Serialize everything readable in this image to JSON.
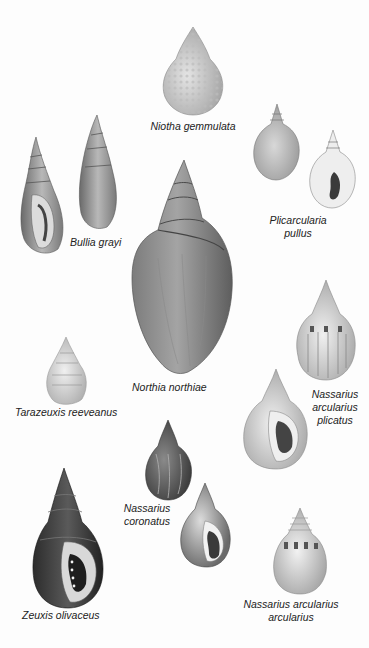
{
  "plate": {
    "background": "#fdfdfd",
    "species": [
      {
        "name": "Niotha gemmulata",
        "lines": [
          "Niotha gemmulata"
        ]
      },
      {
        "name": "Bullia grayi",
        "lines": [
          "Bullia grayi"
        ]
      },
      {
        "name": "Plicarcularia pullus",
        "lines": [
          "Plicarcularia",
          "pullus"
        ]
      },
      {
        "name": "Northia northiae",
        "lines": [
          "Northia northiae"
        ]
      },
      {
        "name": "Tarazeuxis reeveanus",
        "lines": [
          "Tarazeuxis reeveanus"
        ]
      },
      {
        "name": "Nassarius arcularius plicatus",
        "lines": [
          "Nassarius",
          "arcularius",
          "plicatus"
        ]
      },
      {
        "name": "Nassarius coronatus",
        "lines": [
          "Nassarius",
          "coronatus"
        ]
      },
      {
        "name": "Zeuxis olivaceus",
        "lines": [
          "Zeuxis olivaceus"
        ]
      },
      {
        "name": "Nassarius arcularius arcularius",
        "lines": [
          "Nassarius arcularius",
          "arcularius"
        ]
      }
    ]
  }
}
